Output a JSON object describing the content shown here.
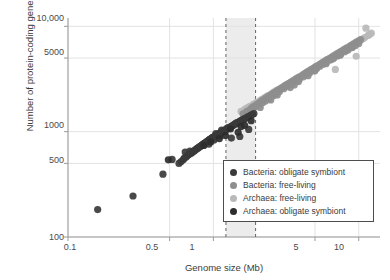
{
  "chart_data": {
    "type": "scatter",
    "title": "",
    "xlabel": "Genome size (Mb)",
    "ylabel": "Number of protein-coding genes",
    "xscale": "log",
    "yscale": "log",
    "xlim": [
      0.1,
      14
    ],
    "ylim": [
      100,
      12000
    ],
    "grid": true,
    "xticks": [
      "0.1",
      "0.5",
      "1",
      "5",
      "10"
    ],
    "xtick_values": [
      0.1,
      0.5,
      1,
      5,
      10
    ],
    "yticks": [
      "100",
      "500",
      "1000",
      "5000",
      "10,000"
    ],
    "ytick_values": [
      100,
      500,
      1000,
      5000,
      10000
    ],
    "legend_position": "lower-right",
    "annotations": {
      "shaded_band": {
        "x_start": 1.22,
        "x_end": 1.95,
        "color": "#ececec"
      },
      "dashed_lines": [
        1.22,
        1.95
      ]
    },
    "series": [
      {
        "name": "Bacteria: obligate symbiont",
        "color": "#3a3a3a",
        "points": [
          [
            0.16,
            182
          ],
          [
            0.28,
            245
          ],
          [
            0.45,
            395
          ],
          [
            0.52,
            545
          ],
          [
            0.58,
            500
          ],
          [
            0.6,
            520
          ],
          [
            0.62,
            540
          ],
          [
            0.63,
            560
          ],
          [
            0.65,
            575
          ],
          [
            0.66,
            590
          ],
          [
            0.67,
            600
          ],
          [
            0.68,
            610
          ],
          [
            0.7,
            620
          ],
          [
            0.71,
            630
          ],
          [
            0.72,
            645
          ],
          [
            0.73,
            650
          ],
          [
            0.74,
            660
          ],
          [
            0.75,
            670
          ],
          [
            0.76,
            680
          ],
          [
            0.77,
            690
          ],
          [
            0.78,
            700
          ],
          [
            0.79,
            705
          ],
          [
            0.8,
            715
          ],
          [
            0.81,
            725
          ],
          [
            0.82,
            730
          ],
          [
            0.83,
            740
          ],
          [
            0.84,
            750
          ],
          [
            0.85,
            760
          ],
          [
            0.86,
            770
          ],
          [
            0.87,
            775
          ],
          [
            0.88,
            785
          ],
          [
            0.89,
            795
          ],
          [
            0.9,
            800
          ],
          [
            0.91,
            810
          ],
          [
            0.92,
            820
          ],
          [
            0.93,
            830
          ],
          [
            0.94,
            840
          ],
          [
            0.95,
            845
          ],
          [
            0.96,
            855
          ],
          [
            0.97,
            865
          ],
          [
            0.98,
            875
          ],
          [
            0.99,
            885
          ],
          [
            1.0,
            890
          ],
          [
            1.02,
            900
          ],
          [
            1.03,
            915
          ],
          [
            1.05,
            925
          ],
          [
            1.06,
            935
          ],
          [
            1.08,
            945
          ],
          [
            1.09,
            955
          ],
          [
            1.1,
            965
          ],
          [
            1.12,
            975
          ],
          [
            1.13,
            985
          ],
          [
            1.15,
            995
          ],
          [
            1.16,
            1005
          ],
          [
            1.18,
            1015
          ],
          [
            1.19,
            1025
          ],
          [
            1.21,
            1040
          ],
          [
            1.22,
            1050
          ],
          [
            1.24,
            1060
          ],
          [
            1.26,
            1075
          ],
          [
            1.28,
            1090
          ],
          [
            1.3,
            1100
          ],
          [
            1.32,
            1115
          ],
          [
            1.34,
            1130
          ],
          [
            1.36,
            1145
          ],
          [
            1.38,
            1160
          ],
          [
            1.4,
            1175
          ],
          [
            1.42,
            1190
          ],
          [
            1.45,
            1205
          ],
          [
            1.48,
            1225
          ],
          [
            1.5,
            1240
          ],
          [
            1.53,
            1260
          ],
          [
            1.56,
            1280
          ],
          [
            1.6,
            1300
          ],
          [
            1.63,
            1320
          ],
          [
            1.66,
            1340
          ],
          [
            1.7,
            1365
          ],
          [
            1.74,
            1390
          ],
          [
            1.78,
            1410
          ],
          [
            1.82,
            1435
          ],
          [
            1.86,
            1460
          ],
          [
            1.9,
            1485
          ],
          [
            1.33,
            870
          ],
          [
            1.52,
            900
          ],
          [
            1.75,
            1050
          ],
          [
            0.64,
            640
          ],
          [
            0.69,
            655
          ],
          [
            1.04,
            960
          ],
          [
            1.14,
            1035
          ],
          [
            1.25,
            1085
          ],
          [
            1.44,
            1210
          ],
          [
            1.58,
            1295
          ],
          [
            0.93,
            760
          ],
          [
            1.01,
            835
          ],
          [
            1.11,
            920
          ],
          [
            1.2,
            1000
          ]
        ]
      },
      {
        "name": "Bacteria: free-living",
        "color": "#8e8e8e",
        "points": [
          [
            1.6,
            1480
          ],
          [
            1.7,
            1560
          ],
          [
            1.8,
            1640
          ],
          [
            1.85,
            1700
          ],
          [
            1.92,
            1760
          ],
          [
            2.0,
            1830
          ],
          [
            2.08,
            1900
          ],
          [
            2.15,
            1960
          ],
          [
            2.22,
            2020
          ],
          [
            2.3,
            2090
          ],
          [
            2.38,
            2150
          ],
          [
            2.45,
            2210
          ],
          [
            2.55,
            2290
          ],
          [
            2.62,
            2350
          ],
          [
            2.72,
            2420
          ],
          [
            2.8,
            2490
          ],
          [
            2.9,
            2560
          ],
          [
            3.0,
            2640
          ],
          [
            3.1,
            2720
          ],
          [
            3.2,
            2800
          ],
          [
            3.32,
            2880
          ],
          [
            3.42,
            2960
          ],
          [
            3.55,
            3050
          ],
          [
            3.68,
            3150
          ],
          [
            3.8,
            3240
          ],
          [
            3.95,
            3340
          ],
          [
            4.1,
            3450
          ],
          [
            4.25,
            3560
          ],
          [
            4.4,
            3670
          ],
          [
            4.55,
            3780
          ],
          [
            4.72,
            3900
          ],
          [
            4.9,
            4020
          ],
          [
            5.05,
            4140
          ],
          [
            5.25,
            4270
          ],
          [
            5.45,
            4400
          ],
          [
            5.65,
            4540
          ],
          [
            5.85,
            4680
          ],
          [
            6.05,
            4820
          ],
          [
            6.3,
            4980
          ],
          [
            6.55,
            5140
          ],
          [
            6.8,
            5300
          ],
          [
            7.05,
            5470
          ],
          [
            7.35,
            5650
          ],
          [
            7.6,
            5820
          ],
          [
            7.9,
            6010
          ],
          [
            8.2,
            6200
          ],
          [
            8.55,
            6400
          ],
          [
            8.85,
            6600
          ],
          [
            9.2,
            6820
          ],
          [
            9.55,
            7040
          ],
          [
            9.9,
            7250
          ],
          [
            10.3,
            7500
          ],
          [
            1.95,
            1720
          ],
          [
            2.05,
            1790
          ],
          [
            2.18,
            1880
          ],
          [
            2.28,
            1950
          ],
          [
            2.42,
            2060
          ],
          [
            2.58,
            2180
          ],
          [
            2.68,
            2260
          ],
          [
            2.85,
            2400
          ],
          [
            3.05,
            2560
          ],
          [
            3.25,
            2700
          ],
          [
            3.48,
            2850
          ],
          [
            3.72,
            3010
          ],
          [
            3.9,
            3140
          ],
          [
            4.15,
            3320
          ],
          [
            4.35,
            3480
          ],
          [
            4.62,
            3640
          ],
          [
            4.85,
            3820
          ],
          [
            5.15,
            4000
          ],
          [
            5.4,
            4180
          ],
          [
            5.7,
            4360
          ],
          [
            6.0,
            4560
          ],
          [
            6.4,
            4780
          ],
          [
            6.75,
            5000
          ],
          [
            7.15,
            5240
          ],
          [
            7.55,
            5480
          ],
          [
            8.0,
            5740
          ],
          [
            8.45,
            6000
          ],
          [
            8.95,
            6280
          ],
          [
            9.45,
            6560
          ],
          [
            10.0,
            6860
          ],
          [
            2.48,
            2000
          ],
          [
            3.38,
            2620
          ],
          [
            4.48,
            3400
          ],
          [
            5.95,
            4420
          ],
          [
            7.45,
            5320
          ],
          [
            9.05,
            6320
          ],
          [
            3.6,
            2780
          ],
          [
            5.0,
            3880
          ],
          [
            6.6,
            4900
          ],
          [
            8.3,
            5920
          ],
          [
            2.1,
            1700
          ],
          [
            2.75,
            2230
          ],
          [
            3.85,
            2990
          ],
          [
            4.98,
            3760
          ]
        ]
      },
      {
        "name": "Archaea: free-living",
        "color": "#b9b9b9",
        "points": [
          [
            1.55,
            1560
          ],
          [
            1.65,
            1640
          ],
          [
            1.78,
            1740
          ],
          [
            1.88,
            1820
          ],
          [
            2.0,
            1910
          ],
          [
            2.12,
            2000
          ],
          [
            2.25,
            2100
          ],
          [
            2.38,
            2200
          ],
          [
            2.5,
            2290
          ],
          [
            2.65,
            2400
          ],
          [
            2.8,
            2510
          ],
          [
            2.95,
            2620
          ],
          [
            3.12,
            2750
          ],
          [
            3.3,
            2880
          ],
          [
            3.5,
            3020
          ],
          [
            3.7,
            3160
          ],
          [
            3.9,
            3300
          ],
          [
            4.15,
            3470
          ],
          [
            4.4,
            3640
          ],
          [
            4.65,
            3810
          ],
          [
            4.95,
            4000
          ],
          [
            5.25,
            4200
          ],
          [
            5.55,
            4400
          ],
          [
            5.9,
            4620
          ],
          [
            6.25,
            4840
          ],
          [
            6.6,
            5070
          ],
          [
            7.0,
            5320
          ],
          [
            7.4,
            5580
          ],
          [
            7.85,
            5860
          ],
          [
            8.3,
            6140
          ],
          [
            8.8,
            6440
          ],
          [
            9.3,
            6760
          ],
          [
            9.85,
            7100
          ],
          [
            10.4,
            7450
          ],
          [
            11.0,
            7820
          ],
          [
            11.6,
            8200
          ],
          [
            12.2,
            8620
          ],
          [
            11.2,
            9600
          ],
          [
            9.6,
            5200
          ],
          [
            6.9,
            3900
          ],
          [
            3.05,
            2680
          ],
          [
            3.4,
            2940
          ],
          [
            4.28,
            3560
          ],
          [
            5.1,
            4100
          ],
          [
            6.05,
            4700
          ],
          [
            7.2,
            5440
          ],
          [
            8.55,
            6280
          ],
          [
            10.1,
            7260
          ],
          [
            2.7,
            2450
          ],
          [
            2.2,
            2050
          ],
          [
            1.95,
            1860
          ],
          [
            1.72,
            1690
          ],
          [
            4.8,
            3900
          ],
          [
            5.7,
            4500
          ],
          [
            6.45,
            4960
          ],
          [
            7.6,
            5700
          ],
          [
            8.05,
            6000
          ],
          [
            9.05,
            6600
          ],
          [
            10.7,
            7620
          ],
          [
            11.9,
            8400
          ],
          [
            2.32,
            2150
          ],
          [
            2.58,
            2350
          ],
          [
            3.22,
            2820
          ],
          [
            3.8,
            3230
          ],
          [
            4.52,
            3720
          ],
          [
            5.4,
            4300
          ],
          [
            6.75,
            5190
          ],
          [
            8.95,
            6520
          ]
        ]
      },
      {
        "name": "Archaea: obligate symbiont",
        "color": "#2d2d2d",
        "points": [
          [
            0.49,
            540
          ],
          [
            0.86,
            740
          ],
          [
            1.31,
            1060
          ],
          [
            1.55,
            1120
          ],
          [
            1.48,
            985
          ],
          [
            1.64,
            1150
          ],
          [
            1.82,
            1270
          ],
          [
            1.1,
            860
          ],
          [
            0.96,
            800
          ],
          [
            1.21,
            920
          ]
        ]
      }
    ]
  },
  "legend": {
    "items": [
      {
        "label": "Bacteria: obligate symbiont",
        "color": "#3a3a3a"
      },
      {
        "label": "Bacteria: free-living",
        "color": "#8e8e8e"
      },
      {
        "label": "Archaea: free-living",
        "color": "#b9b9b9"
      },
      {
        "label": "Archaea: obligate symbiont",
        "color": "#2d2d2d"
      }
    ]
  },
  "axes": {
    "x_title": "Genome size (Mb)",
    "y_title": "Number of protein-coding genes",
    "x_ticks": [
      "0.1",
      "0.5",
      "1",
      "5",
      "10"
    ],
    "y_ticks": [
      "10,000",
      "5000",
      "1000",
      "500",
      "100"
    ]
  },
  "colors": {
    "grid": "#e2e2e2",
    "axis": "#9a9a9a",
    "band": "#ececec",
    "dashed": "#6f6f6f",
    "text": "#3b3b3b"
  }
}
